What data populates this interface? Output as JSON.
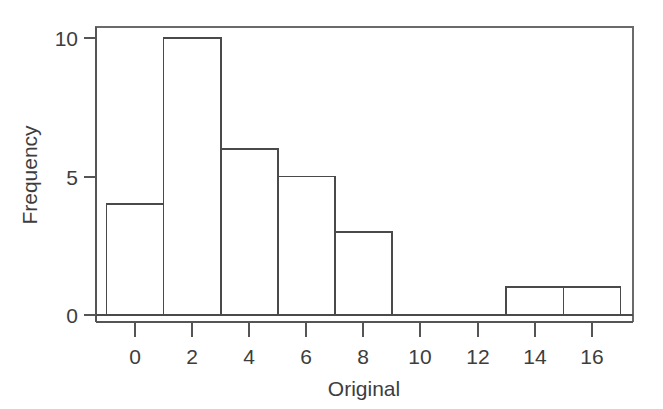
{
  "chart_data": {
    "type": "bar",
    "subtype": "histogram",
    "title": "",
    "xlabel": "Original",
    "ylabel": "Frequency",
    "xlim": [
      -1.6,
      17.6
    ],
    "ylim": [
      -0.25,
      10.6
    ],
    "grid": false,
    "legend": null,
    "bin_width": 2,
    "bin_edges": [
      -1,
      1,
      3,
      5,
      7,
      9,
      11,
      13,
      15,
      17
    ],
    "bins": [
      {
        "start": -1,
        "end": 1,
        "count": 4
      },
      {
        "start": 1,
        "end": 3,
        "count": 10
      },
      {
        "start": 3,
        "end": 5,
        "count": 6
      },
      {
        "start": 5,
        "end": 7,
        "count": 5
      },
      {
        "start": 7,
        "end": 9,
        "count": 3
      },
      {
        "start": 9,
        "end": 11,
        "count": 0
      },
      {
        "start": 11,
        "end": 13,
        "count": 0
      },
      {
        "start": 13,
        "end": 15,
        "count": 1
      },
      {
        "start": 15,
        "end": 17,
        "count": 1
      }
    ],
    "categories": [
      "-1 to 1",
      "1 to 3",
      "3 to 5",
      "5 to 7",
      "7 to 9",
      "9 to 11",
      "11 to 13",
      "13 to 15",
      "15 to 17"
    ],
    "values": [
      4,
      10,
      6,
      5,
      3,
      0,
      0,
      1,
      1
    ],
    "total_count": 30,
    "x_ticks": [
      0,
      2,
      4,
      6,
      8,
      10,
      12,
      14,
      16
    ],
    "x_tick_labels": [
      "0",
      "2",
      "4",
      "6",
      "8",
      "10",
      "12",
      "14",
      "16"
    ],
    "y_ticks": [
      0,
      5,
      10
    ],
    "y_tick_labels": [
      "0",
      "5",
      "10"
    ],
    "colors": {
      "background": "#ffffff",
      "bar_fill": "#ffffff",
      "bar_stroke": "#4a4a4a",
      "axis": "#555555",
      "frame": "#6a6a6a",
      "text": "#3d3d3d"
    }
  },
  "axes": {
    "x_title": "Original",
    "y_title": "Frequency"
  }
}
